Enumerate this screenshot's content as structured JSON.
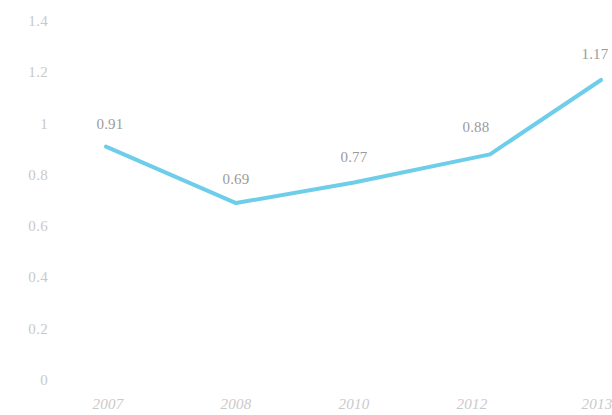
{
  "chart_data": {
    "type": "line",
    "title": "",
    "subtitle": "",
    "xlabel": "",
    "ylabel": "",
    "categories": [
      "2007",
      "2008",
      "2010",
      "2012",
      "2013"
    ],
    "values": [
      0.91,
      0.69,
      0.77,
      0.88,
      1.17
    ],
    "series": [
      {
        "name": "",
        "values": [
          0.91,
          0.69,
          0.77,
          0.88,
          1.17
        ]
      }
    ],
    "point_labels": [
      "0.91",
      "0.69",
      "0.77",
      "0.88",
      "1.17"
    ],
    "ylim": [
      0,
      1.4
    ],
    "y_ticks": [
      "0",
      "0.2",
      "0.4",
      "0.6",
      "0.8",
      "1",
      "1.2",
      "1.4"
    ],
    "y_tick_values": [
      0,
      0.2,
      0.4,
      0.6,
      0.8,
      1,
      1.2,
      1.4
    ],
    "x_ticks": [
      "2007",
      "2008",
      "2010",
      "2012",
      "2013"
    ],
    "grid": false,
    "legend": "none",
    "legend_entries": [],
    "annotations": [],
    "colors": {
      "line": "#6ECEEA",
      "background": "#ffffff",
      "tick_text": "#c9c9c9",
      "label_text": "#9b9b9b"
    }
  }
}
